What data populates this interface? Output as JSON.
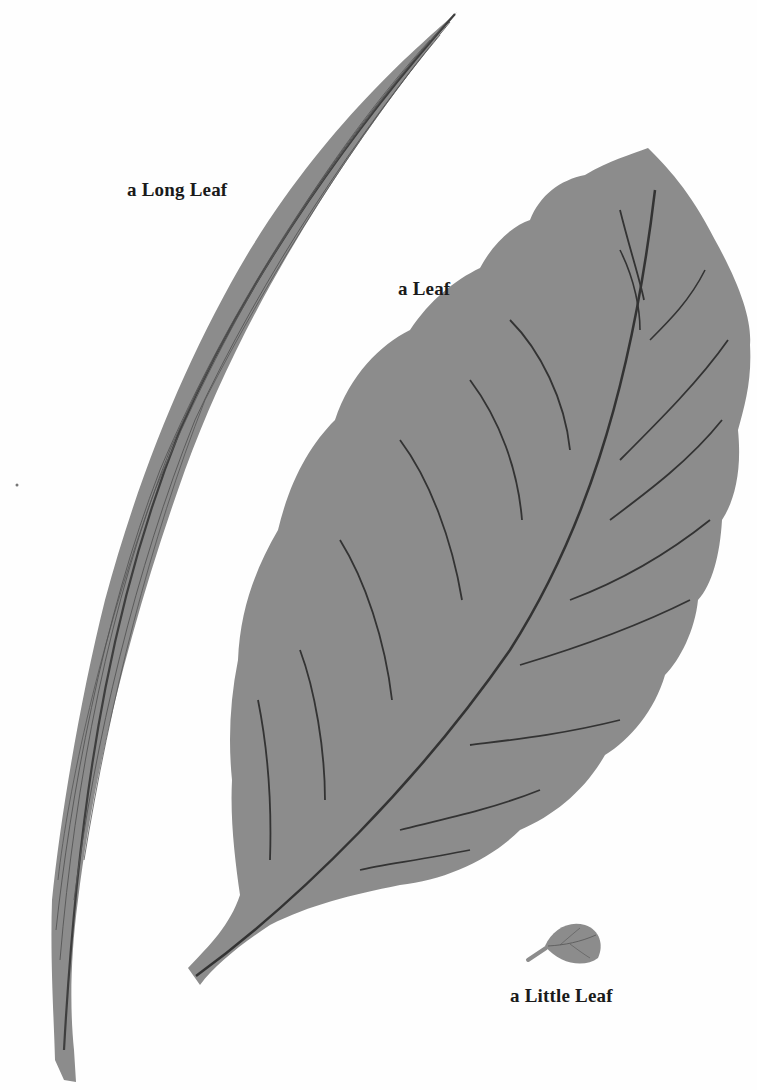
{
  "page": {
    "background": "#fefefe",
    "leaf_fill": "#8c8c8c",
    "vein_color": "#3a3a3a"
  },
  "labels": {
    "long_leaf": "a Long Leaf",
    "leaf": "a Leaf",
    "little_leaf": "a Little Leaf"
  },
  "illustrations": [
    {
      "name": "long-leaf",
      "description": "tall narrow grass-like leaf with parallel veins"
    },
    {
      "name": "big-leaf",
      "description": "large scalloped leaf with central midrib and curved side veins"
    },
    {
      "name": "little-leaf",
      "description": "tiny leaf with short stem"
    }
  ]
}
